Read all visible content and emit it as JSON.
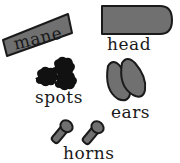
{
  "diagram": {
    "type": "labeled-parts-worksheet",
    "colors": {
      "shape_fill": "#6e6e6e",
      "spot_fill": "#111111",
      "outline": "#1a1a1a",
      "background": "#ffffff",
      "text": "#1a1a1a"
    },
    "parts": [
      {
        "id": "mane",
        "label": "mane",
        "shape": "slanted-rectangle"
      },
      {
        "id": "head",
        "label": "head",
        "shape": "rounded-rectangle"
      },
      {
        "id": "spots",
        "label": "spots",
        "shape": "three-blobs"
      },
      {
        "id": "ears",
        "label": "ears",
        "shape": "two-leaf-ovals"
      },
      {
        "id": "horns",
        "label": "horns",
        "shape": "two-knobbed-pegs"
      }
    ]
  }
}
